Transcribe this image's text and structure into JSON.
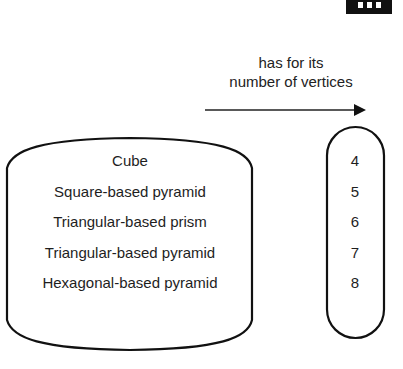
{
  "diagram": {
    "type": "relation-mapping",
    "relation_label": {
      "line1": "has for its",
      "line2": "number of vertices"
    },
    "domain": {
      "shape": "cylinder",
      "items": [
        "Cube",
        "Square-based pyramid",
        "Triangular-based prism",
        "Triangular-based pyramid",
        "Hexagonal-based pyramid"
      ]
    },
    "codomain": {
      "shape": "capsule",
      "items": [
        "4",
        "5",
        "6",
        "7",
        "8"
      ]
    },
    "arrow": {
      "direction": "right"
    },
    "colors": {
      "stroke": "#111111",
      "text": "#1e1e1e",
      "background": "#ffffff"
    }
  }
}
